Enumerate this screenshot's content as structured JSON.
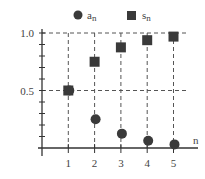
{
  "chart_data": {
    "type": "scatter",
    "title": "",
    "xlabel": "n",
    "ylabel": "",
    "xlim": [
      0,
      5.5
    ],
    "ylim": [
      0,
      1.05
    ],
    "x": [
      1,
      2,
      3,
      4,
      5
    ],
    "x_ticks": [
      "1",
      "2",
      "3",
      "4",
      "5"
    ],
    "y_ticks": [
      "0.5",
      "1.0"
    ],
    "grid": "dashed at x=1..5 and y=0.5, 1.0",
    "legend_position": "top",
    "series": [
      {
        "name": "a_n",
        "label": "a",
        "subscript": "n",
        "marker": "circle",
        "values": [
          0.5,
          0.25,
          0.125,
          0.0625,
          0.03125
        ]
      },
      {
        "name": "s_n",
        "label": "s",
        "subscript": "n",
        "marker": "square",
        "values": [
          0.5,
          0.75,
          0.875,
          0.9375,
          0.96875
        ]
      }
    ]
  },
  "colors": {
    "marker": "#3a3a3a",
    "axis": "#333333",
    "grid": "#555555",
    "text": "#444444"
  }
}
